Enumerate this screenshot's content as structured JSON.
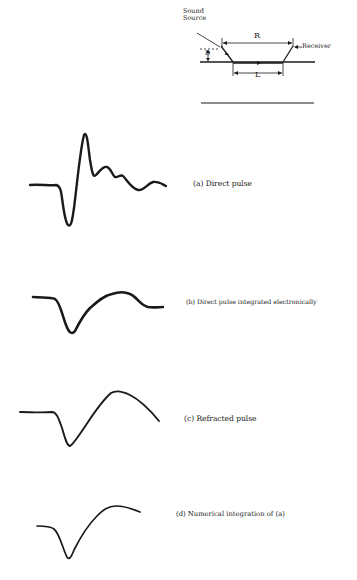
{
  "geometry_diagram": {
    "source_label": "Sound\nSource",
    "source_line1": "Sound",
    "source_line2": "Source",
    "receiver_label": "Receiver",
    "r_label": "R",
    "l_label": "L",
    "d_label": "D"
  },
  "traces": [
    {
      "id": "a",
      "caption": "(a) Direct pulse"
    },
    {
      "id": "b",
      "caption": "(b) Direct pulse integrated electronically"
    },
    {
      "id": "c",
      "caption": "(c) Refracted pulse"
    },
    {
      "id": "d",
      "caption": "(d) Numerical integration of (a)"
    }
  ],
  "colors": {
    "ink": "#1a1a1a",
    "background": "#ffffff"
  }
}
